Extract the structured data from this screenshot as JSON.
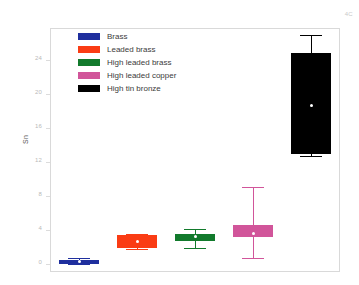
{
  "corner_mark": "4C",
  "legend": {
    "items": [
      {
        "label": "Brass",
        "color": "#1f2f9e"
      },
      {
        "label": "Leaded brass",
        "color": "#fa3c14"
      },
      {
        "label": "High leaded brass",
        "color": "#127a2c"
      },
      {
        "label": "High leaded copper",
        "color": "#d playful"
      },
      {
        "label": "High tin bronze",
        "color": "#000000"
      }
    ]
  },
  "chart_data": {
    "type": "box",
    "title": "",
    "xlabel": "",
    "ylabel": "Sn",
    "ylim": [
      -1.0,
      27.8
    ],
    "grid": false,
    "legend_position": "upper-left",
    "categories": [
      "Brass",
      "Leaded brass",
      "High leaded brass",
      "High leaded copper",
      "High tin bronze"
    ],
    "yticks": [
      0,
      4,
      8,
      12,
      16,
      20,
      24
    ],
    "ytick_labels": [
      "0",
      "4",
      "8",
      "12",
      "16",
      "20",
      "24"
    ],
    "boxes": [
      {
        "name": "Brass",
        "color": "#1f2f9e",
        "whisker_low": 0.0,
        "q1": 0.0,
        "median": 0.2,
        "q3": 0.45,
        "whisker_high": 0.6
      },
      {
        "name": "Leaded brass",
        "color": "#fa3c14",
        "whisker_low": 1.7,
        "q1": 1.8,
        "median": 2.6,
        "q3": 3.4,
        "whisker_high": 3.5
      },
      {
        "name": "High leaded brass",
        "color": "#127a2c",
        "whisker_low": 1.8,
        "q1": 2.7,
        "median": 3.2,
        "q3": 3.5,
        "whisker_high": 4.1
      },
      {
        "name": "High leaded copper",
        "color": "#d1559a",
        "whisker_low": 0.7,
        "q1": 3.1,
        "median": 3.5,
        "q3": 4.5,
        "whisker_high": 9.0
      },
      {
        "name": "High tin bronze",
        "color": "#000000",
        "whisker_low": 12.7,
        "q1": 12.9,
        "median": 18.7,
        "q3": 24.8,
        "whisker_high": 27.0
      }
    ]
  }
}
